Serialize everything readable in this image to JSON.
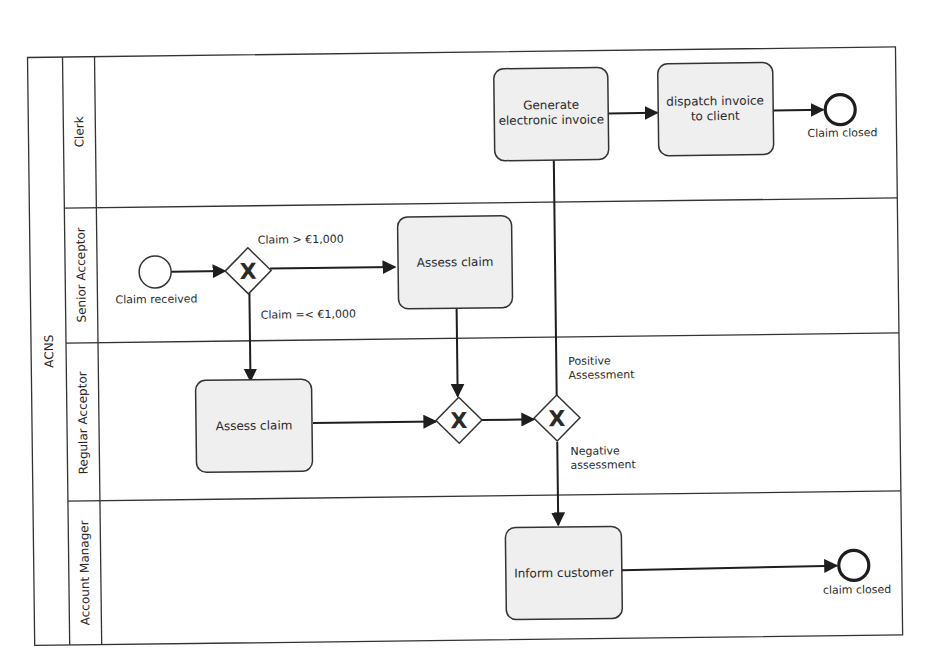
{
  "pool": {
    "label": "ACNS"
  },
  "lanes": [
    {
      "id": "clerk",
      "label": "Clerk"
    },
    {
      "id": "senior",
      "label": "Senior Acceptor"
    },
    {
      "id": "regular",
      "label": "Regular Acceptor"
    },
    {
      "id": "account",
      "label": "Account Manager"
    }
  ],
  "events": {
    "start": {
      "label": "Claim received",
      "type": "start"
    },
    "end_clerk": {
      "label": "Claim closed",
      "type": "end"
    },
    "end_account": {
      "label": "claim closed",
      "type": "end"
    }
  },
  "tasks": {
    "generate_invoice": {
      "line1": "Generate",
      "line2": "electronic invoice",
      "lane": "Clerk"
    },
    "dispatch_invoice": {
      "line1": "dispatch invoice",
      "line2": "to client",
      "lane": "Clerk"
    },
    "assess_senior": {
      "label": "Assess claim",
      "lane": "Senior Acceptor"
    },
    "assess_regular": {
      "label": "Assess claim",
      "lane": "Regular Acceptor"
    },
    "inform_customer": {
      "label": "Inform customer",
      "lane": "Account Manager"
    }
  },
  "gateways": {
    "split_amount": {
      "type": "exclusive",
      "marker": "X"
    },
    "merge": {
      "type": "exclusive",
      "marker": "X"
    },
    "assessment": {
      "type": "exclusive",
      "marker": "X"
    }
  },
  "flows": {
    "high_claim": "Claim > €1,000",
    "low_claim": "Claim =< €1,000",
    "positive_l1": "Positive",
    "positive_l2": "Assessment",
    "negative_l1": "Negative",
    "negative_l2": "assessment"
  }
}
